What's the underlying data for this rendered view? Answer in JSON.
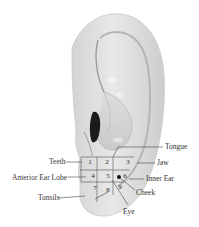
{
  "diagram": {
    "zones": [
      {
        "number": "1",
        "organ": "Teeth"
      },
      {
        "number": "2",
        "organ": "Tongue"
      },
      {
        "number": "3",
        "organ": "Jaw"
      },
      {
        "number": "4",
        "organ": "Anterior Ear Lobe"
      },
      {
        "number": "5",
        "organ": ""
      },
      {
        "number": "6",
        "organ": "Inner Ear"
      },
      {
        "number": "7",
        "organ": "Tonsils"
      },
      {
        "number": "8",
        "organ": "Eye"
      },
      {
        "number": "9",
        "organ": ""
      }
    ],
    "labels": {
      "teeth": "Teeth",
      "anterior_ear_lobe": "Anterior Ear Lobe",
      "tonsils": "Tonsils",
      "tongue": "Tongue",
      "jaw": "Jaw",
      "inner_ear": "Inner Ear",
      "cheek": "Cheek",
      "eye": "Eye"
    },
    "colors": {
      "skin_light": "#e9e9e9",
      "skin_mid": "#cfcfcf",
      "skin_dark": "#9a9a9a",
      "line": "#444444",
      "text": "#333333"
    }
  }
}
